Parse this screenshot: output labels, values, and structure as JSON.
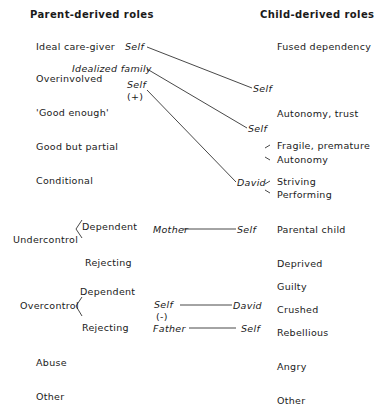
{
  "headers": {
    "parent": "Parent-derived roles",
    "child": "Child-derived roles"
  },
  "parent_roles": [
    "Ideal care-giver",
    "Overinvolved",
    "'Good enough'",
    "Good but partial",
    "Conditional",
    "Undercontrol",
    "Overcontrol",
    "Abuse",
    "Other"
  ],
  "undercontrol_branches": [
    "Dependent",
    "Rejecting"
  ],
  "overcontrol_branches": [
    "Dependent",
    "Rejecting"
  ],
  "child_roles": [
    "Fused dependency",
    "Autonomy, trust",
    "Fragile, premature",
    "Autonomy",
    "Striving",
    "Performing",
    "Parental child",
    "Deprived",
    "Guilty",
    "Crushed",
    "Rebellious",
    "Angry",
    "Other"
  ],
  "links": [
    {
      "from": "Self",
      "to": "Self"
    },
    {
      "from": "Idealized family",
      "to": "Self"
    },
    {
      "from": "Self",
      "from_sign": "(+)",
      "to": "David"
    },
    {
      "from": "Mother",
      "to": "Self"
    },
    {
      "from": "Self",
      "from_sign": "(-)",
      "to": "David"
    },
    {
      "from": "Father",
      "to": "Self"
    }
  ]
}
